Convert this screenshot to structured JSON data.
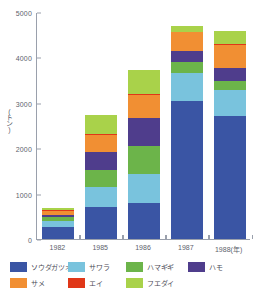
{
  "chart_data": {
    "type": "bar",
    "stacked": true,
    "title": "",
    "xlabel": "年",
    "ylabel": "(トン)",
    "categories": [
      "1982",
      "1985",
      "1986",
      "1987",
      "1988(年)"
    ],
    "ylim": [
      0,
      5000
    ],
    "yticks": [
      0,
      1000,
      2000,
      3000,
      4000,
      5000
    ],
    "grid": false,
    "legend_position": "bottom",
    "series": [
      {
        "name": "ソウダガツオ",
        "color": "#3a55a4",
        "values": [
          270,
          710,
          790,
          3050,
          2700
        ]
      },
      {
        "name": "サワラ",
        "color": "#79c3dd",
        "values": [
          120,
          440,
          650,
          610,
          580
        ]
      },
      {
        "name": "ハマギギ",
        "color": "#6cb44a",
        "values": [
          95,
          380,
          610,
          230,
          190
        ]
      },
      {
        "name": "ハモ",
        "color": "#4f3d8c",
        "values": [
          40,
          380,
          620,
          250,
          290
        ]
      },
      {
        "name": "サメ",
        "color": "#f18f33",
        "values": [
          90,
          390,
          510,
          410,
          520
        ]
      },
      {
        "name": "エイ",
        "color": "#e03718",
        "values": [
          30,
          20,
          20,
          15,
          15
        ]
      },
      {
        "name": "フエダイ",
        "color": "#a9d24a",
        "values": [
          35,
          410,
          530,
          130,
          290
        ]
      }
    ],
    "totals": [
      680,
      2730,
      3730,
      4695,
      4585
    ]
  },
  "axis": {
    "y_unit": "(トン)",
    "tick_labels": [
      "5000",
      "4000",
      "3000",
      "2000",
      "1000",
      "0"
    ]
  },
  "legend": {
    "items": [
      {
        "label": "ソウダガツオ",
        "color": "#3a55a4"
      },
      {
        "label": "サワラ",
        "color": "#79c3dd"
      },
      {
        "label": "ハマギギ",
        "color": "#6cb44a"
      },
      {
        "label": "ハモ",
        "color": "#4f3d8c"
      },
      {
        "label": "サメ",
        "color": "#f18f33"
      },
      {
        "label": "エイ",
        "color": "#e03718"
      },
      {
        "label": "フエダイ",
        "color": "#a9d24a"
      }
    ]
  }
}
